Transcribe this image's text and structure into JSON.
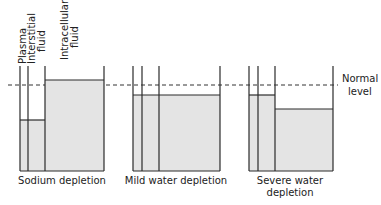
{
  "diagram": {
    "compartment_labels": [
      "Plasma",
      "Interstitial fluid",
      "Intracellular fluid"
    ],
    "reference_line_label": [
      "Normal",
      "level"
    ],
    "colors": {
      "fill": "#e4e4e4",
      "line": "#2a2a2a",
      "dash": "#333333"
    },
    "panels": [
      {
        "name": "sodium-depletion",
        "caption": [
          "Sodium depletion"
        ],
        "levels": {
          "extracellular": "below normal",
          "intracellular": "above normal"
        }
      },
      {
        "name": "mild-water-depletion",
        "caption": [
          "Mild water depletion"
        ],
        "levels": {
          "extracellular": "slightly below normal",
          "intracellular": "slightly below normal"
        }
      },
      {
        "name": "severe-water-depletion",
        "caption": [
          "Severe water",
          "depletion"
        ],
        "levels": {
          "extracellular": "slightly below normal",
          "intracellular": "well below normal"
        }
      }
    ]
  }
}
